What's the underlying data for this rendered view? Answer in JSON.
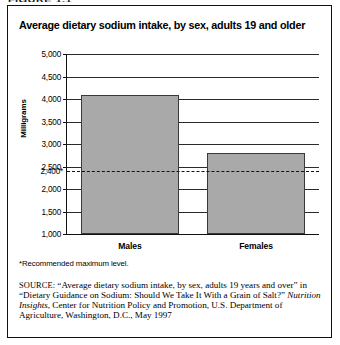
{
  "figure": {
    "caption_clipped": "FIGURE 1.1",
    "title": "Average dietary sodium intake, by sex, adults 19 and older",
    "footnote": "*Recommended maximum level.",
    "source": {
      "label": "SOURCE:",
      "part1": "“Average dietary sodium intake, by sex, adults 19 years and over” in “Dietary Guidance on Sodium: Should We Take It With a Grain of Salt?” ",
      "italic": "Nutrition Insights",
      "part2": ", Center for Nutrition Policy and Promotion, U.S. Department of Agriculture, Washington, D.C., May 1997"
    }
  },
  "chart_data": {
    "type": "bar",
    "title": "Average dietary sodium intake, by sex, adults 19 and older",
    "categories": [
      "Males",
      "Females"
    ],
    "values": [
      4100,
      2800
    ],
    "xlabel": "",
    "ylabel": "Milligrams",
    "ylim": [
      1000,
      5000
    ],
    "ytick_labels": [
      "5,000",
      "4,500",
      "4,000",
      "3,500",
      "3,000",
      "2,500",
      "2,000",
      "1,500",
      "1,000"
    ],
    "yticks": [
      5000,
      4500,
      4000,
      3500,
      3000,
      2500,
      2000,
      1500,
      1000
    ],
    "grid": true,
    "legend": "none",
    "bar_color": "#a9a9a9",
    "bar_edge_color": "#3a3a3a",
    "annotations": [
      {
        "name": "recommended-maximum",
        "value": 2400,
        "label": "2,400*",
        "style": "dashed"
      }
    ]
  }
}
